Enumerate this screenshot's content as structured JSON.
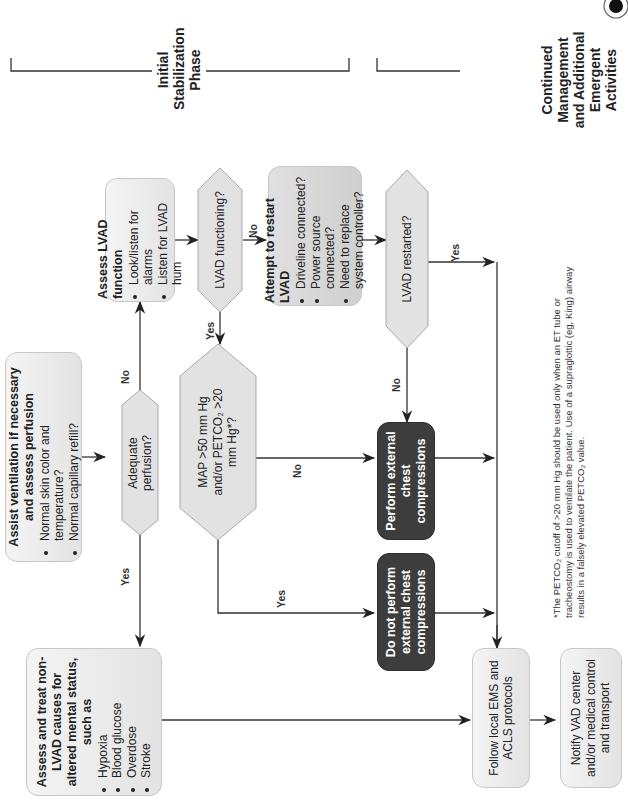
{
  "figure": {
    "orientation": "rotated 90deg counter-clockwise",
    "phases": [
      {
        "label": "Initial Stabilization Phase"
      },
      {
        "label": "Continued Management and Additional Emergent Activities"
      }
    ],
    "nodes": {
      "assist": {
        "title": "Assist ventilation if necessary and assess perfusion",
        "bullets": [
          "Normal skin color and temperature?",
          "Normal capillary refill?"
        ]
      },
      "adequate": {
        "label": "Adequate perfusion?"
      },
      "assess_lvad": {
        "title": "Assess LVAD function",
        "bullets": [
          "Look/listen for alarms",
          "Listen for LVAD hum"
        ]
      },
      "lvad_functioning": {
        "label": "LVAD functioning?"
      },
      "attempt_restart": {
        "title": "Attempt to restart LVAD",
        "bullets": [
          "Driveline connected?",
          "Power source connected?",
          "Need to replace system controller?"
        ]
      },
      "lvad_restarted": {
        "label": "LVAD restarted?"
      },
      "map_decision": {
        "label": "MAP >50 mm Hg and/or PETCO₂ >20 mm Hg*?"
      },
      "non_lvad": {
        "title": "Assess and treat non-LVAD causes for altered mental status, such as",
        "bullets": [
          "Hypoxia",
          "Blood glucose",
          "Overdose",
          "Stroke"
        ]
      },
      "perform_cpr": {
        "label": "Perform external chest compressions"
      },
      "no_cpr": {
        "label": "Do not perform external chest compressions"
      },
      "follow_ems": {
        "label": "Follow local EMS and ACLS protocols"
      },
      "notify_vad": {
        "label": "Notify VAD center and/or medical control and transport"
      }
    },
    "edge_labels": {
      "adequate_no": "No",
      "adequate_yes": "Yes",
      "functioning_no": "No",
      "functioning_yes": "Yes",
      "restarted_no": "No",
      "restarted_yes": "Yes",
      "map_no": "No",
      "map_yes": "Yes"
    },
    "footnote": "*The PETCO₂ cutoff of >20 mm Hg should be used only when an ET tube or tracheostomy is used to ventilate the patient. Use of a supraglottic (eg, King) airway results in a falsely elevated PETCO₂ value.",
    "colors": {
      "light_box": "#ebebeb",
      "dark_box": "#3d3d3d",
      "line": "#333333"
    }
  }
}
